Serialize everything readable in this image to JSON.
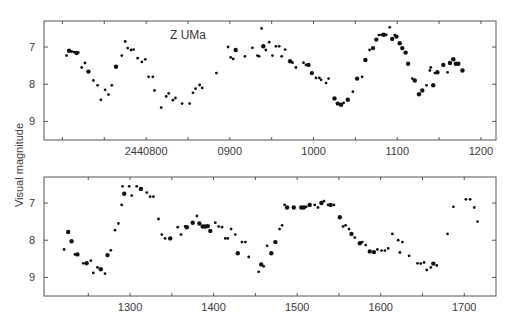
{
  "chart_data": {
    "type": "scatter",
    "title": "Z UMa",
    "ylabel": "Visual magnitude",
    "xlabel": "",
    "y_inverted": true,
    "grid": false,
    "legend": null,
    "panels": [
      {
        "name": "top",
        "xlim": [
          678,
          1218
        ],
        "ylim": [
          9.5,
          6.3
        ],
        "x_ticks": [
          {
            "value": 800,
            "label": "2440800"
          },
          {
            "value": 900,
            "label": "0900"
          },
          {
            "value": 1000,
            "label": "1000"
          },
          {
            "value": 1100,
            "label": "1100"
          },
          {
            "value": 1200,
            "label": "1200"
          }
        ],
        "x_minor_ticks": [
          700,
          750,
          850,
          950,
          1050,
          1150
        ],
        "y_ticks": [
          {
            "value": 7,
            "label": "7"
          },
          {
            "value": 8,
            "label": "8"
          },
          {
            "value": 9,
            "label": "9"
          }
        ],
        "annotation": "Z UMa",
        "points": [
          [
            705,
            7.23,
            1
          ],
          [
            708,
            7.1,
            2
          ],
          [
            711,
            7.12,
            1
          ],
          [
            714,
            7.14,
            1
          ],
          [
            717,
            7.16,
            2
          ],
          [
            719,
            7.15,
            1
          ],
          [
            723,
            7.55,
            1
          ],
          [
            727,
            7.43,
            1
          ],
          [
            731,
            7.66,
            2
          ],
          [
            737,
            7.9,
            1
          ],
          [
            742,
            8.03,
            1
          ],
          [
            746,
            8.42,
            1
          ],
          [
            751,
            8.15,
            1
          ],
          [
            755,
            8.28,
            1
          ],
          [
            759,
            8.03,
            1
          ],
          [
            764,
            7.53,
            2
          ],
          [
            771,
            7.23,
            1
          ],
          [
            775,
            6.85,
            1
          ],
          [
            778,
            7.03,
            1
          ],
          [
            782,
            7.08,
            1
          ],
          [
            785,
            7.07,
            1
          ],
          [
            790,
            7.3,
            1
          ],
          [
            795,
            7.4,
            1
          ],
          [
            799,
            7.33,
            1
          ],
          [
            803,
            7.8,
            1
          ],
          [
            808,
            7.8,
            1
          ],
          [
            810,
            8.17,
            1
          ],
          [
            818,
            8.63,
            1
          ],
          [
            824,
            8.33,
            1
          ],
          [
            827,
            8.25,
            1
          ],
          [
            832,
            8.43,
            1
          ],
          [
            835,
            8.37,
            1
          ],
          [
            843,
            8.52,
            1
          ],
          [
            852,
            8.52,
            1
          ],
          [
            856,
            8.23,
            1
          ],
          [
            859,
            8.12,
            1
          ],
          [
            864,
            8.02,
            1
          ],
          [
            867,
            8.1,
            1
          ],
          [
            884,
            7.7,
            1
          ],
          [
            898,
            7.0,
            1
          ],
          [
            901,
            7.28,
            1
          ],
          [
            904,
            7.32,
            1
          ],
          [
            907,
            7.08,
            2
          ],
          [
            918,
            7.25,
            1
          ],
          [
            927,
            7.02,
            1
          ],
          [
            933,
            7.23,
            1
          ],
          [
            935,
            7.25,
            1
          ],
          [
            938,
            6.5,
            1
          ],
          [
            940,
            6.98,
            2
          ],
          [
            943,
            7.08,
            1
          ],
          [
            947,
            6.87,
            1
          ],
          [
            951,
            7.23,
            1
          ],
          [
            955,
            6.98,
            1
          ],
          [
            959,
            6.98,
            1
          ],
          [
            962,
            7.25,
            1
          ],
          [
            966,
            7.07,
            1
          ],
          [
            972,
            7.38,
            2
          ],
          [
            975,
            7.42,
            1
          ],
          [
            979,
            7.55,
            1
          ],
          [
            988,
            7.42,
            1
          ],
          [
            991,
            7.48,
            1
          ],
          [
            994,
            7.48,
            2
          ],
          [
            998,
            7.7,
            2
          ],
          [
            1003,
            7.83,
            1
          ],
          [
            1007,
            7.83,
            1
          ],
          [
            1009,
            7.88,
            1
          ],
          [
            1015,
            7.97,
            1
          ],
          [
            1018,
            7.85,
            1
          ],
          [
            1025,
            8.38,
            2
          ],
          [
            1029,
            8.52,
            2
          ],
          [
            1033,
            8.55,
            2
          ],
          [
            1036,
            8.5,
            1
          ],
          [
            1041,
            8.42,
            2
          ],
          [
            1047,
            8.2,
            1
          ],
          [
            1052,
            7.85,
            2
          ],
          [
            1058,
            7.8,
            1
          ],
          [
            1062,
            7.35,
            2
          ],
          [
            1067,
            7.08,
            1
          ],
          [
            1071,
            7.03,
            2
          ],
          [
            1075,
            6.8,
            2
          ],
          [
            1078,
            6.68,
            1
          ],
          [
            1081,
            6.67,
            1
          ],
          [
            1084,
            6.67,
            2
          ],
          [
            1087,
            6.67,
            1
          ],
          [
            1091,
            6.47,
            1
          ],
          [
            1094,
            6.78,
            2
          ],
          [
            1097,
            6.68,
            1
          ],
          [
            1099,
            6.72,
            2
          ],
          [
            1103,
            6.9,
            2
          ],
          [
            1106,
            7.03,
            2
          ],
          [
            1110,
            7.15,
            2
          ],
          [
            1113,
            7.45,
            2
          ],
          [
            1118,
            7.85,
            1
          ],
          [
            1121,
            7.9,
            2
          ],
          [
            1126,
            8.27,
            2
          ],
          [
            1130,
            8.17,
            2
          ],
          [
            1135,
            8.03,
            1
          ],
          [
            1139,
            7.63,
            1
          ],
          [
            1140,
            7.55,
            1
          ],
          [
            1143,
            8.03,
            2
          ],
          [
            1145,
            7.7,
            1
          ],
          [
            1148,
            7.68,
            2
          ],
          [
            1155,
            7.48,
            2
          ],
          [
            1160,
            7.68,
            1
          ],
          [
            1163,
            7.43,
            2
          ],
          [
            1167,
            7.33,
            2
          ],
          [
            1170,
            7.45,
            2
          ],
          [
            1173,
            7.45,
            2
          ],
          [
            1178,
            7.63,
            2
          ]
        ]
      },
      {
        "name": "bottom",
        "xlim": [
          1197,
          1738
        ],
        "ylim": [
          9.5,
          6.3
        ],
        "x_ticks": [
          {
            "value": 1300,
            "label": "1300"
          },
          {
            "value": 1400,
            "label": "1400"
          },
          {
            "value": 1500,
            "label": "1500"
          },
          {
            "value": 1600,
            "label": "1600"
          },
          {
            "value": 1700,
            "label": "1700"
          }
        ],
        "x_minor_ticks": [
          1250,
          1350,
          1450,
          1550,
          1650
        ],
        "y_ticks": [
          {
            "value": 7,
            "label": "7"
          },
          {
            "value": 8,
            "label": "8"
          },
          {
            "value": 9,
            "label": "9"
          }
        ],
        "points": [
          [
            1221,
            8.25,
            1
          ],
          [
            1226,
            7.78,
            2
          ],
          [
            1230,
            8.03,
            2
          ],
          [
            1234,
            8.38,
            1
          ],
          [
            1237,
            8.38,
            2
          ],
          [
            1244,
            8.62,
            1
          ],
          [
            1248,
            8.62,
            2
          ],
          [
            1253,
            8.55,
            1
          ],
          [
            1256,
            8.88,
            1
          ],
          [
            1261,
            8.73,
            1
          ],
          [
            1265,
            8.78,
            2
          ],
          [
            1270,
            8.9,
            1
          ],
          [
            1273,
            8.4,
            2
          ],
          [
            1277,
            8.27,
            1
          ],
          [
            1282,
            7.73,
            1
          ],
          [
            1286,
            7.55,
            1
          ],
          [
            1290,
            7.05,
            1
          ],
          [
            1291,
            6.55,
            1
          ],
          [
            1293,
            6.75,
            2
          ],
          [
            1299,
            6.55,
            1
          ],
          [
            1302,
            6.8,
            1
          ],
          [
            1308,
            6.55,
            1
          ],
          [
            1313,
            6.62,
            2
          ],
          [
            1320,
            6.72,
            1
          ],
          [
            1324,
            6.83,
            1
          ],
          [
            1328,
            6.83,
            1
          ],
          [
            1334,
            7.43,
            1
          ],
          [
            1338,
            7.85,
            1
          ],
          [
            1342,
            7.95,
            1
          ],
          [
            1348,
            7.95,
            2
          ],
          [
            1357,
            7.65,
            1
          ],
          [
            1361,
            7.85,
            1
          ],
          [
            1366,
            7.63,
            1
          ],
          [
            1368,
            7.65,
            2
          ],
          [
            1375,
            7.53,
            2
          ],
          [
            1380,
            7.35,
            1
          ],
          [
            1383,
            7.55,
            2
          ],
          [
            1387,
            7.63,
            2
          ],
          [
            1390,
            7.63,
            2
          ],
          [
            1393,
            7.62,
            2
          ],
          [
            1396,
            7.75,
            2
          ],
          [
            1402,
            7.53,
            1
          ],
          [
            1406,
            7.63,
            1
          ],
          [
            1410,
            7.65,
            1
          ],
          [
            1414,
            7.95,
            1
          ],
          [
            1417,
            7.95,
            1
          ],
          [
            1421,
            7.7,
            1
          ],
          [
            1426,
            7.85,
            1
          ],
          [
            1429,
            8.35,
            2
          ],
          [
            1434,
            8.05,
            1
          ],
          [
            1438,
            8.05,
            1
          ],
          [
            1442,
            8.45,
            1
          ],
          [
            1454,
            8.85,
            1
          ],
          [
            1457,
            8.65,
            2
          ],
          [
            1460,
            8.7,
            1
          ],
          [
            1464,
            8.15,
            1
          ],
          [
            1469,
            8.35,
            2
          ],
          [
            1474,
            8.05,
            2
          ],
          [
            1479,
            7.7,
            1
          ],
          [
            1482,
            7.6,
            1
          ],
          [
            1485,
            7.05,
            1
          ],
          [
            1488,
            7.12,
            2
          ],
          [
            1496,
            7.12,
            2
          ],
          [
            1505,
            7.12,
            2
          ],
          [
            1508,
            7.12,
            2
          ],
          [
            1511,
            7.1,
            1
          ],
          [
            1515,
            7.05,
            2
          ],
          [
            1521,
            7.05,
            1
          ],
          [
            1525,
            7.12,
            1
          ],
          [
            1529,
            7.0,
            2
          ],
          [
            1532,
            6.95,
            1
          ],
          [
            1537,
            7.05,
            1
          ],
          [
            1540,
            7.05,
            2
          ],
          [
            1544,
            7.05,
            1
          ],
          [
            1551,
            7.38,
            2
          ],
          [
            1555,
            7.63,
            1
          ],
          [
            1558,
            7.6,
            1
          ],
          [
            1562,
            7.7,
            1
          ],
          [
            1565,
            7.83,
            2
          ],
          [
            1569,
            7.93,
            1
          ],
          [
            1575,
            8.08,
            2
          ],
          [
            1578,
            8.05,
            1
          ],
          [
            1582,
            8.13,
            1
          ],
          [
            1587,
            8.3,
            2
          ],
          [
            1592,
            8.32,
            2
          ],
          [
            1596,
            8.25,
            1
          ],
          [
            1601,
            8.28,
            1
          ],
          [
            1605,
            8.28,
            1
          ],
          [
            1609,
            8.22,
            1
          ],
          [
            1614,
            7.83,
            1
          ],
          [
            1621,
            8.0,
            1
          ],
          [
            1623,
            8.33,
            1
          ],
          [
            1626,
            8.05,
            1
          ],
          [
            1634,
            8.42,
            1
          ],
          [
            1644,
            8.62,
            1
          ],
          [
            1648,
            8.63,
            1
          ],
          [
            1652,
            8.6,
            1
          ],
          [
            1655,
            8.8,
            1
          ],
          [
            1660,
            8.73,
            1
          ],
          [
            1663,
            8.63,
            2
          ],
          [
            1667,
            8.68,
            1
          ],
          [
            1680,
            7.83,
            1
          ],
          [
            1687,
            7.1,
            1
          ],
          [
            1702,
            6.9,
            1
          ],
          [
            1707,
            6.9,
            1
          ],
          [
            1712,
            7.12,
            1
          ],
          [
            1716,
            7.5,
            1
          ]
        ]
      }
    ]
  }
}
